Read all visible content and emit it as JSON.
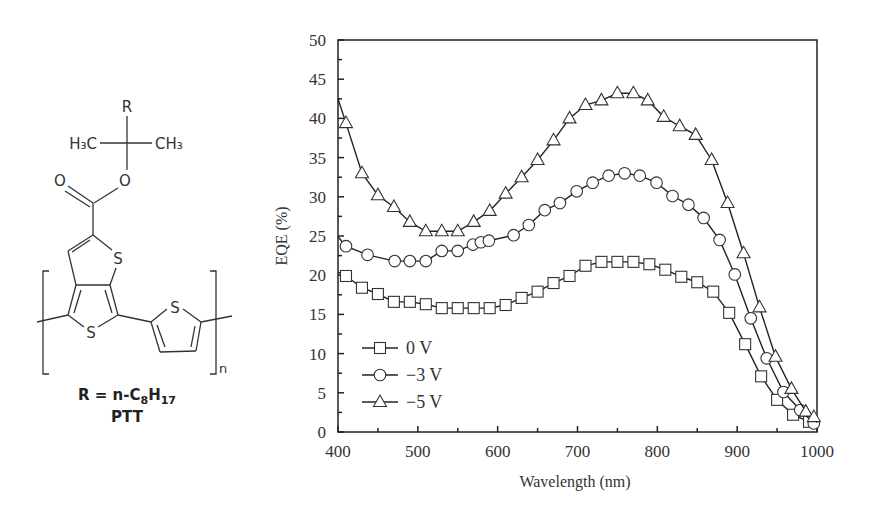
{
  "structure": {
    "substituent_label": "R",
    "methyl_left": "H₃C",
    "methyl_right": "CH₃",
    "carbonyl_oxygen": "O",
    "ester_oxygen": "O",
    "sulfur_atoms": [
      "S",
      "S",
      "S"
    ],
    "repeat_subscript": "n",
    "r_definition": {
      "prefix": "R = n-C",
      "sub1": "8",
      "mid": "H",
      "sub2": "17"
    },
    "name": "PTT"
  },
  "chart_data": {
    "type": "line",
    "title": "",
    "xlabel": "Wavelength (nm)",
    "ylabel": "EQE (%)",
    "xlim": [
      400,
      1000
    ],
    "ylim": [
      0,
      50
    ],
    "x_ticks": [
      400,
      500,
      600,
      700,
      800,
      900,
      1000
    ],
    "y_ticks": [
      0,
      5,
      10,
      15,
      20,
      25,
      30,
      35,
      40,
      45,
      50
    ],
    "grid": false,
    "legend_position": "lower left (inside plot)",
    "series": [
      {
        "name": "0 V",
        "marker": "square",
        "x": [
          400,
          410,
          430,
          450,
          470,
          490,
          510,
          530,
          550,
          570,
          590,
          610,
          630,
          650,
          670,
          690,
          710,
          730,
          750,
          770,
          790,
          810,
          830,
          850,
          870,
          890,
          910,
          930,
          950,
          970,
          990,
          1000
        ],
        "values": [
          20.4,
          19.9,
          18.4,
          17.6,
          16.6,
          16.6,
          16.3,
          15.8,
          15.8,
          15.8,
          15.8,
          16.2,
          17.1,
          17.9,
          19.0,
          19.9,
          21.2,
          21.7,
          21.7,
          21.7,
          21.4,
          20.7,
          19.8,
          19.1,
          17.9,
          15.2,
          11.2,
          7.1,
          4.1,
          2.2,
          1.3,
          1.0
        ]
      },
      {
        "name": "−3 V",
        "marker": "circle",
        "x": [
          400,
          410,
          437,
          471,
          490,
          510,
          530,
          550,
          569,
          579,
          589,
          620,
          639,
          659,
          678,
          699,
          719,
          739,
          759,
          778,
          799,
          819,
          839,
          858,
          878,
          897,
          917,
          937,
          958,
          979,
          996,
          1000
        ],
        "values": [
          24.9,
          23.7,
          22.6,
          21.8,
          21.8,
          21.8,
          23.1,
          23.1,
          23.9,
          24.2,
          24.4,
          25.1,
          26.4,
          28.3,
          29.2,
          30.7,
          31.8,
          32.7,
          33.0,
          32.7,
          31.8,
          30.1,
          29.0,
          27.3,
          24.5,
          20.1,
          14.5,
          9.4,
          5.1,
          2.8,
          1.1,
          1.0
        ]
      },
      {
        "name": "−5 V",
        "marker": "triangle",
        "x": [
          400,
          410,
          430,
          450,
          470,
          490,
          510,
          530,
          550,
          570,
          590,
          610,
          630,
          650,
          670,
          690,
          710,
          730,
          750,
          770,
          788,
          808,
          828,
          848,
          868,
          888,
          908,
          928,
          948,
          968,
          986,
          996,
          1000
        ],
        "values": [
          42.5,
          39.4,
          33.0,
          30.2,
          28.7,
          26.8,
          25.6,
          25.6,
          25.6,
          26.8,
          28.2,
          30.4,
          32.5,
          34.7,
          37.2,
          40.0,
          41.7,
          42.3,
          43.2,
          43.2,
          42.3,
          40.2,
          39.0,
          37.9,
          34.7,
          29.2,
          22.8,
          15.9,
          9.6,
          5.5,
          2.6,
          1.9,
          1.2
        ]
      }
    ]
  }
}
